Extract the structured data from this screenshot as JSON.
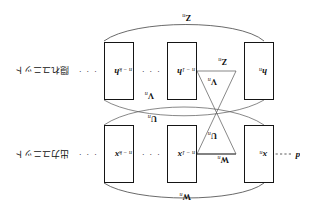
{
  "figure": {
    "rotation_degrees": 180,
    "background_color": "#ffffff",
    "line_color": "#151515"
  },
  "rows": [
    {
      "id": "output-row",
      "row_label": "出力ユニット",
      "variable": "x",
      "units": [
        {
          "base": "x",
          "index": "n"
        },
        {
          "base": "x",
          "index": "n − 1"
        },
        {
          "base": "x",
          "index": "n − k"
        }
      ],
      "leading_label": "d",
      "ellipsis": "· · ·"
    },
    {
      "id": "hidden-row",
      "row_label": "隠れユニット",
      "variable": "h",
      "units": [
        {
          "base": "h",
          "index": "n"
        },
        {
          "base": "h",
          "index": "n − 1"
        },
        {
          "base": "h",
          "index": "n − k"
        }
      ],
      "ellipsis": "· · ·"
    }
  ],
  "weights": {
    "w_top_arc": {
      "base": "W",
      "index": "n"
    },
    "w_inline": {
      "base": "W",
      "index": "n"
    },
    "u_left": {
      "base": "U",
      "index": "n"
    },
    "u_arc": {
      "base": "U",
      "index": "n"
    },
    "v_inline": {
      "base": "V",
      "index": "n"
    },
    "v_arc": {
      "base": "V",
      "index": "n"
    },
    "z_inline": {
      "base": "Z",
      "index": "n"
    },
    "z_bottom_arc": {
      "base": "Z",
      "index": "n"
    }
  },
  "ellipsis_marks": {
    "row_tail": "· · ·",
    "between_boxes": "· · ·",
    "lead_in": "· · ·"
  }
}
